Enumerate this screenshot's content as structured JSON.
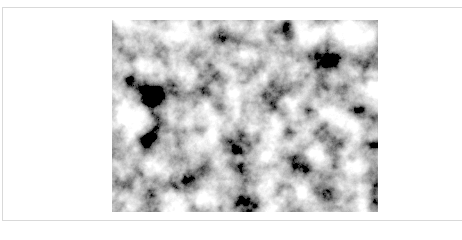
{
  "viewer": {
    "image": {
      "alt": "Grayscale fractal noise texture (cloud-like black and white pattern)",
      "colors": {
        "dark": "#1a1a1a",
        "light": "#ffffff"
      }
    }
  }
}
